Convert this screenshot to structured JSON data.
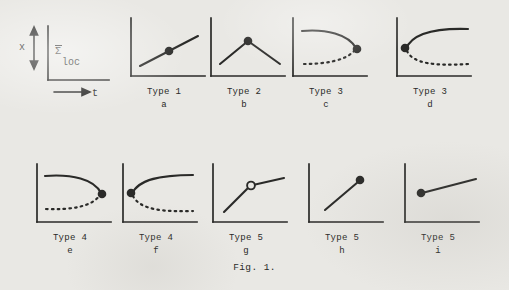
{
  "figure": {
    "caption": "Fig. 1.",
    "axis_legend": {
      "y_label": "x",
      "x_label": "t",
      "curve_label_main": "Σ",
      "curve_label_sub": "loc",
      "y_arrow": "double-vertical-arrow",
      "x_arrow": "right-arrow"
    },
    "panels": [
      {
        "id": "a",
        "type_label": "Type 1",
        "sub_label": "a",
        "marker": "filled-dot",
        "marker_position": "midpoint",
        "description": "rising straight line with filled dot at the middle"
      },
      {
        "id": "b",
        "type_label": "Type 2",
        "sub_label": "b",
        "marker": "filled-dot",
        "marker_position": "apex",
        "description": "rising then falling peak with filled dot at the apex"
      },
      {
        "id": "c",
        "type_label": "Type 3",
        "sub_label": "c",
        "marker": "filled-dot",
        "marker_position": "right-fold",
        "description": "solid upper branch bending down to dot at right, dotted lower branch curving up to meet it"
      },
      {
        "id": "d",
        "type_label": "Type 3",
        "sub_label": "d",
        "marker": "filled-dot",
        "marker_position": "left-fold",
        "description": "solid upper branch rising from dot at left, dotted lower branch descending to the right"
      },
      {
        "id": "e",
        "type_label": "Type 4",
        "sub_label": "e",
        "marker": "filled-dot",
        "marker_position": "right-fold",
        "description": "flat solid upper branch bending down to dot at right, long flat dotted lower branch"
      },
      {
        "id": "f",
        "type_label": "Type 4",
        "sub_label": "f",
        "marker": "filled-dot",
        "marker_position": "left-fold",
        "description": "solid upper branch rising from dot at left and flattening, dotted lower branch flattening to the right"
      },
      {
        "id": "g",
        "type_label": "Type 5",
        "sub_label": "g",
        "marker": "open-circle",
        "marker_position": "kink",
        "description": "steep rising segment meeting a shallower segment at an open circle"
      },
      {
        "id": "h",
        "type_label": "Type 5",
        "sub_label": "h",
        "marker": "filled-dot",
        "marker_position": "line-end",
        "description": "steeply rising line ending at a filled dot"
      },
      {
        "id": "i",
        "type_label": "Type 5",
        "sub_label": "i",
        "marker": "filled-dot",
        "marker_position": "line-start",
        "description": "line beginning at a filled dot and rising gently to the right"
      }
    ]
  },
  "colors": {
    "paper": "#e9e8e4",
    "ink": "#2a2a28"
  }
}
